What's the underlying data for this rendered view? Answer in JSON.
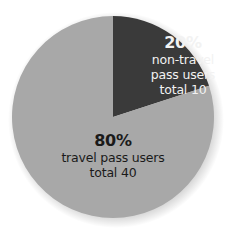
{
  "chart_data": {
    "type": "pie",
    "title": "",
    "start_angle_deg": 0,
    "direction": "clockwise",
    "slices": [
      {
        "label": "non-travel pass users",
        "percent": 20,
        "total": 10,
        "color": "#3a3a3a",
        "percent_label": "20%",
        "line1": "non-travel",
        "line2": "pass users",
        "total_label": "total 10"
      },
      {
        "label": "travel pass users",
        "percent": 80,
        "total": 40,
        "color": "#a8a8a8",
        "percent_label": "80%",
        "line1": "travel pass users",
        "total_label": "total 40"
      }
    ]
  }
}
